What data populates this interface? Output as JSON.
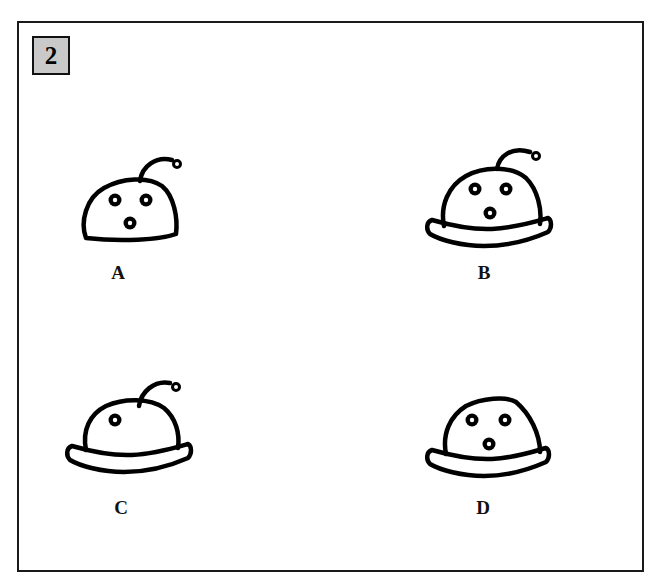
{
  "question": {
    "number": "2",
    "badge_color": "#c9c9c9"
  },
  "options": [
    {
      "label": "A",
      "features": {
        "antenna": true,
        "eyes": 3,
        "brim": false
      }
    },
    {
      "label": "B",
      "features": {
        "antenna": true,
        "eyes": 3,
        "brim": true
      }
    },
    {
      "label": "C",
      "features": {
        "antenna": true,
        "eyes": 1,
        "brim": true
      }
    },
    {
      "label": "D",
      "features": {
        "antenna": false,
        "eyes": 3,
        "brim": true
      }
    }
  ]
}
